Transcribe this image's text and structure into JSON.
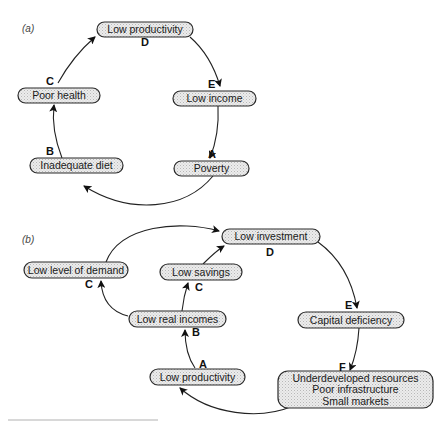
{
  "figure": {
    "panels": [
      {
        "id": "a",
        "label": "(a)",
        "nodes": [
          {
            "id": "a-low-productivity",
            "text": [
              "Low productivity"
            ],
            "letter": "D"
          },
          {
            "id": "a-low-income",
            "text": [
              "Low income"
            ],
            "letter": "E"
          },
          {
            "id": "a-poverty",
            "text": [
              "Poverty"
            ],
            "letter": "A"
          },
          {
            "id": "a-inadequate-diet",
            "text": [
              "Inadequate diet"
            ],
            "letter": "B"
          },
          {
            "id": "a-poor-health",
            "text": [
              "Poor health"
            ],
            "letter": "C"
          }
        ],
        "edges": [
          {
            "from": "a-low-productivity",
            "to": "a-low-income"
          },
          {
            "from": "a-low-income",
            "to": "a-poverty"
          },
          {
            "from": "a-poverty",
            "to": "a-inadequate-diet"
          },
          {
            "from": "a-inadequate-diet",
            "to": "a-poor-health"
          },
          {
            "from": "a-poor-health",
            "to": "a-low-productivity"
          }
        ]
      },
      {
        "id": "b",
        "label": "(b)",
        "nodes": [
          {
            "id": "b-low-investment",
            "text": [
              "Low investment"
            ],
            "letter": "D"
          },
          {
            "id": "b-low-level-of-demand",
            "text": [
              "Low level of demand"
            ],
            "letter": "C"
          },
          {
            "id": "b-low-savings",
            "text": [
              "Low savings"
            ],
            "letter": "C"
          },
          {
            "id": "b-low-real-incomes",
            "text": [
              "Low real incomes"
            ],
            "letter": "B"
          },
          {
            "id": "b-capital-deficiency",
            "text": [
              "Capital deficiency"
            ],
            "letter": "E"
          },
          {
            "id": "b-underdeveloped",
            "text": [
              "Underdeveloped resources",
              "Poor infrastructure",
              "Small markets"
            ],
            "letter": "F"
          },
          {
            "id": "b-low-productivity",
            "text": [
              "Low productivity"
            ],
            "letter": "A"
          }
        ],
        "edges": [
          {
            "from": "b-low-level-of-demand",
            "to": "b-low-investment"
          },
          {
            "from": "b-low-savings",
            "to": "b-low-investment"
          },
          {
            "from": "b-low-investment",
            "to": "b-capital-deficiency"
          },
          {
            "from": "b-capital-deficiency",
            "to": "b-underdeveloped"
          },
          {
            "from": "b-underdeveloped",
            "to": "b-low-productivity"
          },
          {
            "from": "b-low-productivity",
            "to": "b-low-real-incomes"
          },
          {
            "from": "b-low-real-incomes",
            "to": "b-low-savings"
          },
          {
            "from": "b-low-real-incomes",
            "to": "b-low-level-of-demand"
          }
        ]
      }
    ]
  }
}
